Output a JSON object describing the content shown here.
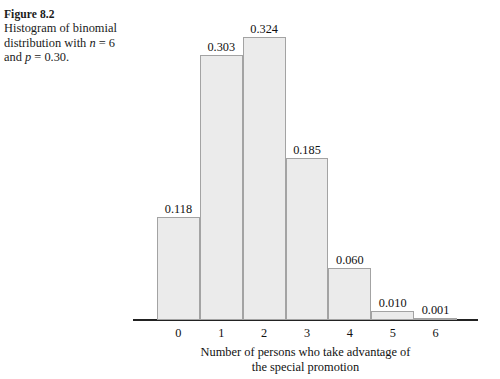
{
  "caption": {
    "title": "Figure 8.2",
    "line1_a": "Histogram of binomial",
    "line2_a": "distribution with ",
    "line2_var": "n",
    "line2_b": " = 6",
    "line3_a": "and ",
    "line3_var": "p",
    "line3_b": " = 0.30."
  },
  "chart_data": {
    "type": "bar",
    "title": "",
    "subtitle": "",
    "categories": [
      "0",
      "1",
      "2",
      "3",
      "4",
      "5",
      "6"
    ],
    "values": [
      0.118,
      0.303,
      0.324,
      0.185,
      0.06,
      0.01,
      0.001
    ],
    "value_labels": [
      "0.118",
      "0.303",
      "0.324",
      "0.185",
      "0.060",
      "0.010",
      "0.001"
    ],
    "xlabel_line1": "Number of persons who take advantage of",
    "xlabel_line2": "the special promotion",
    "ylabel": "",
    "ylim": [
      0,
      0.366
    ],
    "xlim": [
      -0.5,
      6.5
    ],
    "grid": false,
    "legend": false,
    "bar_fill": "#ebebeb",
    "bar_stroke": "#a3a3a3",
    "axis_color": "#222222"
  }
}
